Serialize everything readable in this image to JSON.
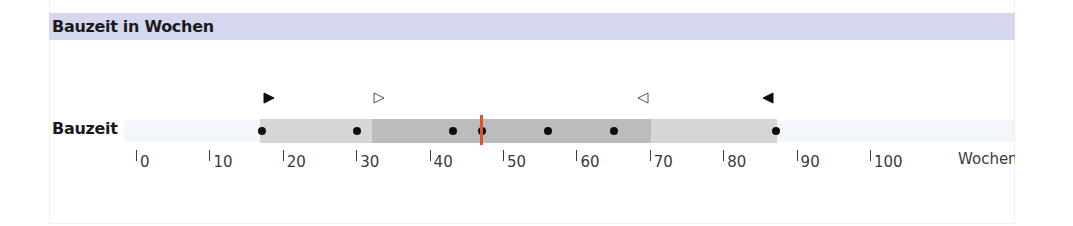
{
  "header": {
    "title": "Bauzeit in Wochen",
    "band_color": "#d5d7ef"
  },
  "row": {
    "label": "Bauzeit"
  },
  "axis": {
    "unit_label": "Wochen",
    "ticks": [
      "0",
      "10",
      "20",
      "30",
      "40",
      "50",
      "60",
      "70",
      "80",
      "90",
      "100"
    ]
  },
  "colors": {
    "bar_light": "#d4d6d7",
    "bar_dark": "#babcbd",
    "median": "#d9532e",
    "dot": "#0d0d0d"
  },
  "chart_data": {
    "type": "boxplot-range",
    "title": "Bauzeit in Wochen",
    "xlabel": "Wochen",
    "ylabel": "",
    "categories": [
      "Bauzeit"
    ],
    "xlim": [
      0,
      100
    ],
    "x_ticks": [
      0,
      10,
      20,
      30,
      40,
      50,
      60,
      70,
      80,
      90,
      100
    ],
    "grid": false,
    "series": [
      {
        "name": "Bauzeit",
        "min": 17,
        "max": 87,
        "inner_range": [
          32,
          70
        ],
        "median": 47,
        "points": [
          17,
          30,
          43,
          47,
          56,
          65,
          87
        ],
        "markers": {
          "filled_right_triangle": 18,
          "open_right_triangle": 33,
          "open_left_triangle": 69,
          "filled_left_triangle": 86
        }
      }
    ]
  }
}
